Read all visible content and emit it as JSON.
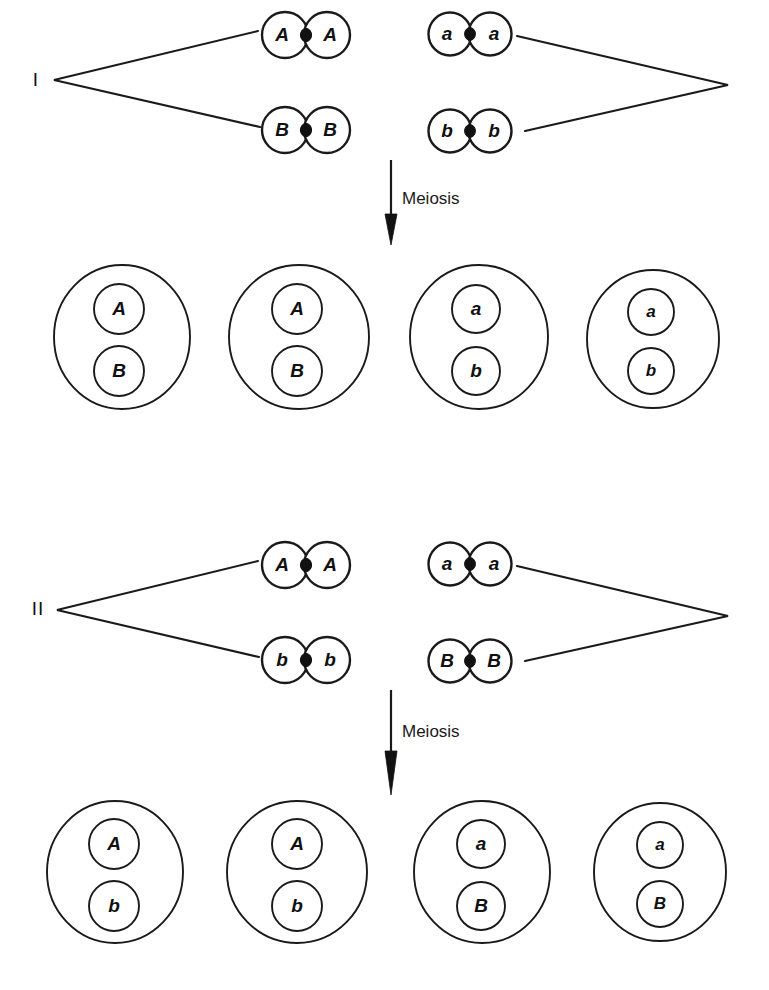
{
  "figure": {
    "width": 769,
    "height": 990,
    "background_color": "#ffffff",
    "line_color": "#1a1a1a",
    "centromere_color": "#111111"
  },
  "panels": [
    {
      "id": "panel-I",
      "roman_label": "I",
      "meiosis_label": "Meiosis",
      "chromosome_pairs": [
        {
          "id": "pair-I-top-left",
          "left_allele": "A",
          "right_allele": "A"
        },
        {
          "id": "pair-I-top-right",
          "left_allele": "a",
          "right_allele": "a"
        },
        {
          "id": "pair-I-bot-left",
          "left_allele": "B",
          "right_allele": "B"
        },
        {
          "id": "pair-I-bot-right",
          "left_allele": "b",
          "right_allele": "b"
        }
      ],
      "gametes": [
        {
          "id": "gamete-I-1",
          "top_allele": "A",
          "bottom_allele": "B"
        },
        {
          "id": "gamete-I-2",
          "top_allele": "A",
          "bottom_allele": "B"
        },
        {
          "id": "gamete-I-3",
          "top_allele": "a",
          "bottom_allele": "b"
        },
        {
          "id": "gamete-I-4",
          "top_allele": "a",
          "bottom_allele": "b"
        }
      ]
    },
    {
      "id": "panel-II",
      "roman_label": "II",
      "meiosis_label": "Meiosis",
      "chromosome_pairs": [
        {
          "id": "pair-II-top-left",
          "left_allele": "A",
          "right_allele": "A"
        },
        {
          "id": "pair-II-top-right",
          "left_allele": "a",
          "right_allele": "a"
        },
        {
          "id": "pair-II-bot-left",
          "left_allele": "b",
          "right_allele": "b"
        },
        {
          "id": "pair-II-bot-right",
          "left_allele": "B",
          "right_allele": "B"
        }
      ],
      "gametes": [
        {
          "id": "gamete-II-1",
          "top_allele": "A",
          "bottom_allele": "b"
        },
        {
          "id": "gamete-II-2",
          "top_allele": "A",
          "bottom_allele": "b"
        },
        {
          "id": "gamete-II-3",
          "top_allele": "a",
          "bottom_allele": "B"
        },
        {
          "id": "gamete-II-4",
          "top_allele": "a",
          "bottom_allele": "B"
        }
      ]
    }
  ]
}
